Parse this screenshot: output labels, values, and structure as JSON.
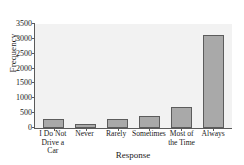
{
  "chart_data": {
    "type": "bar",
    "title": "",
    "xlabel": "Response",
    "ylabel": "Frequency",
    "categories": [
      "I Do Not\nDrive a Car",
      "Never",
      "Rarely",
      "Sometimes",
      "Most of\nthe Time",
      "Always"
    ],
    "category_lines": [
      [
        "I Do Not",
        "Drive a Car"
      ],
      [
        "Never",
        ""
      ],
      [
        "Rarely",
        ""
      ],
      [
        "Sometimes",
        ""
      ],
      [
        "Most of",
        "the Time"
      ],
      [
        "Always",
        ""
      ]
    ],
    "values": [
      290,
      150,
      290,
      390,
      720,
      3130
    ],
    "ylim": [
      0,
      3500
    ],
    "yticks": [
      0,
      500,
      1000,
      1500,
      2000,
      2500,
      3000,
      3500
    ],
    "ytick_labels": [
      "0",
      "500",
      "1000",
      "1500",
      "2000",
      "2500",
      "3000",
      "3500"
    ],
    "grid": false,
    "legend": null,
    "colors": {
      "bar_fill": "#a9a9a9",
      "bar_edge": "#5c5c5c",
      "plot_background": "#f2f2f2",
      "axis": "#5a5a5a",
      "text": "#1a1a1a",
      "figure_background": "#ffffff"
    }
  }
}
